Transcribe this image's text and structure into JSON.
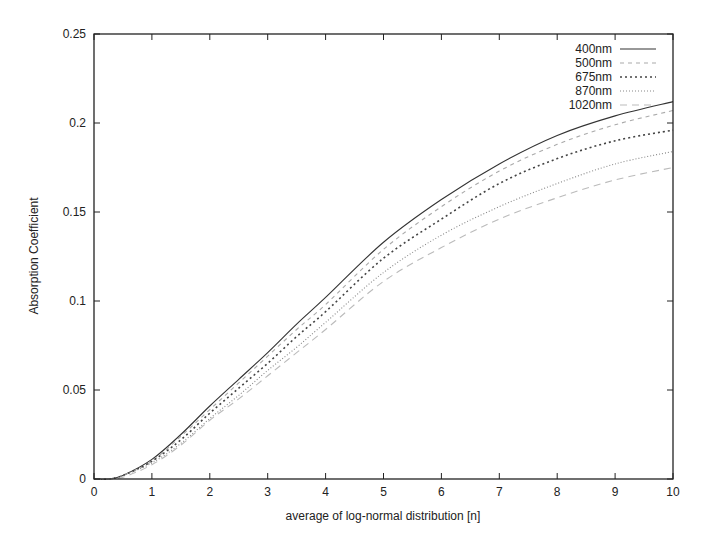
{
  "chart_data": {
    "type": "line",
    "title": "",
    "xlabel": "average of log-normal distribution [n]",
    "ylabel": "Absorption Coefficient",
    "xlim": [
      0,
      10
    ],
    "ylim": [
      0,
      0.25
    ],
    "xticks": [
      "0",
      "1",
      "2",
      "3",
      "4",
      "5",
      "6",
      "7",
      "8",
      "9",
      "10"
    ],
    "yticks": [
      "0",
      "0.05",
      "0.1",
      "0.15",
      "0.2",
      "0.25"
    ],
    "grid": false,
    "legend_position": "top-right",
    "x": [
      0,
      0.25,
      0.5,
      1,
      1.5,
      2,
      2.5,
      3,
      3.5,
      4,
      5,
      6,
      7,
      8,
      9,
      10
    ],
    "series": [
      {
        "name": "400nm",
        "style": "solid",
        "color": "#333333",
        "values": [
          0,
          0,
          0.002,
          0.011,
          0.025,
          0.041,
          0.056,
          0.071,
          0.087,
          0.102,
          0.133,
          0.157,
          0.177,
          0.193,
          0.204,
          0.212
        ]
      },
      {
        "name": "500nm",
        "style": "dashed",
        "color": "#aaaaaa",
        "values": [
          0,
          0,
          0.002,
          0.01,
          0.024,
          0.039,
          0.054,
          0.069,
          0.084,
          0.098,
          0.129,
          0.153,
          0.173,
          0.188,
          0.199,
          0.207
        ]
      },
      {
        "name": "675nm",
        "style": "dotted",
        "color": "#444444",
        "values": [
          0,
          0,
          0.002,
          0.01,
          0.022,
          0.037,
          0.051,
          0.065,
          0.08,
          0.094,
          0.124,
          0.146,
          0.166,
          0.18,
          0.19,
          0.196
        ]
      },
      {
        "name": "870nm",
        "style": "dash-dot",
        "color": "#888888",
        "values": [
          0,
          0,
          0.002,
          0.009,
          0.02,
          0.034,
          0.047,
          0.061,
          0.074,
          0.088,
          0.116,
          0.137,
          0.153,
          0.166,
          0.177,
          0.184
        ]
      },
      {
        "name": "1020nm",
        "style": "long-dash",
        "color": "#bbbbbb",
        "values": [
          0,
          0,
          0.001,
          0.008,
          0.019,
          0.033,
          0.045,
          0.058,
          0.071,
          0.084,
          0.111,
          0.13,
          0.146,
          0.158,
          0.168,
          0.175
        ]
      }
    ]
  }
}
